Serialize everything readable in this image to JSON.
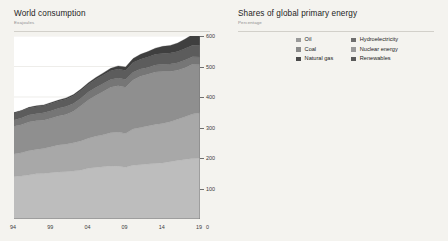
{
  "charts": [
    {
      "id": "world-consumption",
      "title": "World consumption",
      "subtitle": "Exajoules",
      "legend": [
        {
          "label": "Renewables",
          "color": "#3f3f3f"
        },
        {
          "label": "Hydroelectricity",
          "color": "#5c5c5c"
        },
        {
          "label": "Nuclear energy",
          "color": "#767676"
        },
        {
          "label": "Coal",
          "color": "#8f8f8f"
        },
        {
          "label": "Natural gas",
          "color": "#a8a8a8"
        },
        {
          "label": "Oil",
          "color": "#bdbdbd"
        }
      ],
      "yticks": [
        "600",
        "500",
        "400",
        "300",
        "200",
        "100"
      ],
      "xticks": [
        "94",
        "99",
        "04",
        "09",
        "14",
        "19"
      ],
      "zero": "0"
    },
    {
      "id": "shares-of-global-primary-energy",
      "title": "Shares of global primary energy",
      "subtitle": "Percentage",
      "legend_col1": [
        {
          "label": "Oil",
          "color": "#9a9a9a"
        },
        {
          "label": "Coal",
          "color": "#8a8a8a"
        },
        {
          "label": "Natural gas",
          "color": "#4a4a4a"
        }
      ],
      "legend_col2": [
        {
          "label": "Hydroelectricity",
          "color": "#6e6e6e"
        },
        {
          "label": "Nuclear energy",
          "color": "#9a9a9a"
        },
        {
          "label": "Renewables",
          "color": "#5a5a5a"
        }
      ],
      "yticks": [
        "50",
        "40",
        "30",
        "20",
        "10"
      ],
      "xticks": [
        "94",
        "99",
        "04",
        "09",
        "14",
        "19"
      ],
      "zero": "0"
    }
  ],
  "chart_data": [
    {
      "type": "area",
      "title": "World consumption",
      "subtitle": "Exajoules",
      "xlabel": "",
      "ylabel": "Exajoules",
      "ylim": [
        0,
        600
      ],
      "xlim": [
        1994,
        2019
      ],
      "grid": true,
      "legend_position": "top-left",
      "stacked": true,
      "x": [
        1994,
        1995,
        1996,
        1997,
        1998,
        1999,
        2000,
        2001,
        2002,
        2003,
        2004,
        2005,
        2006,
        2007,
        2008,
        2009,
        2010,
        2011,
        2012,
        2013,
        2014,
        2015,
        2016,
        2017,
        2018,
        2019
      ],
      "series": [
        {
          "name": "Oil",
          "color": "#bdbdbd",
          "values": [
            139,
            141,
            144,
            148,
            149,
            152,
            154,
            155,
            157,
            160,
            166,
            169,
            171,
            174,
            173,
            170,
            176,
            178,
            180,
            182,
            184,
            188,
            192,
            195,
            198,
            199
          ]
        },
        {
          "name": "Natural gas",
          "color": "#a8a8a8",
          "values": [
            74,
            76,
            80,
            80,
            82,
            85,
            89,
            90,
            93,
            96,
            99,
            102,
            105,
            109,
            112,
            110,
            119,
            122,
            125,
            128,
            129,
            131,
            135,
            140,
            146,
            149
          ]
        },
        {
          "name": "Coal",
          "color": "#8f8f8f",
          "values": [
            91,
            92,
            94,
            94,
            93,
            93,
            95,
            98,
            103,
            115,
            125,
            134,
            142,
            149,
            152,
            152,
            161,
            168,
            170,
            172,
            171,
            165,
            161,
            161,
            163,
            158
          ]
        },
        {
          "name": "Nuclear energy",
          "color": "#767676",
          "values": [
            21,
            22,
            23,
            23,
            24,
            25,
            25,
            26,
            26,
            25,
            26,
            26,
            26,
            25,
            25,
            25,
            25,
            24,
            22,
            23,
            23,
            24,
            24,
            25,
            25,
            25
          ]
        },
        {
          "name": "Hydroelectricity",
          "color": "#5c5c5c",
          "values": [
            22,
            23,
            23,
            23,
            23,
            24,
            24,
            24,
            25,
            25,
            26,
            27,
            28,
            29,
            30,
            30,
            32,
            32,
            34,
            35,
            36,
            36,
            37,
            38,
            38,
            38
          ]
        },
        {
          "name": "Renewables",
          "color": "#3f3f3f",
          "values": [
            2,
            2,
            2,
            3,
            3,
            3,
            3,
            4,
            4,
            5,
            5,
            6,
            7,
            8,
            10,
            11,
            13,
            16,
            18,
            20,
            23,
            25,
            28,
            31,
            35,
            39
          ]
        }
      ],
      "yticks": [
        100,
        200,
        300,
        400,
        500,
        600
      ],
      "xticks": [
        1994,
        1999,
        2004,
        2009,
        2014,
        2019
      ]
    },
    {
      "type": "line",
      "title": "Shares of global primary energy",
      "subtitle": "Percentage",
      "xlabel": "",
      "ylabel": "Percentage",
      "ylim": [
        0,
        50
      ],
      "xlim": [
        1994,
        2019
      ],
      "grid": true,
      "legend_position": "top-center",
      "x": [
        1994,
        1995,
        1996,
        1997,
        1998,
        1999,
        2000,
        2001,
        2002,
        2003,
        2004,
        2005,
        2006,
        2007,
        2008,
        2009,
        2010,
        2011,
        2012,
        2013,
        2014,
        2015,
        2016,
        2017,
        2018,
        2019
      ],
      "series": [
        {
          "name": "Oil",
          "color": "#9a9a9a",
          "values": [
            39.5,
            39.3,
            39.3,
            39.4,
            39.3,
            39.2,
            38.7,
            38.4,
            38.0,
            37.4,
            37.1,
            36.5,
            35.9,
            35.3,
            34.7,
            34.6,
            33.9,
            33.4,
            33.1,
            32.9,
            32.7,
            32.8,
            33.0,
            32.9,
            32.9,
            33.1
          ]
        },
        {
          "name": "Coal",
          "color": "#8a8a8a",
          "values": [
            26.0,
            25.8,
            25.8,
            25.6,
            25.0,
            24.8,
            25.0,
            25.3,
            25.8,
            27.2,
            28.2,
            28.9,
            29.5,
            30.0,
            30.0,
            29.8,
            30.0,
            30.5,
            30.3,
            30.3,
            30.1,
            28.9,
            28.1,
            27.8,
            27.6,
            27.0
          ]
        },
        {
          "name": "Natural gas",
          "color": "#4a4a4a",
          "values": [
            21.2,
            21.3,
            21.7,
            21.4,
            21.6,
            21.8,
            22.3,
            22.3,
            22.6,
            22.8,
            22.6,
            22.6,
            22.6,
            23.0,
            23.1,
            23.2,
            23.4,
            23.3,
            23.5,
            23.6,
            23.5,
            23.6,
            24.0,
            24.2,
            24.4,
            24.5
          ]
        },
        {
          "name": "Nuclear energy",
          "color": "#9a9a9a",
          "values": [
            6.9,
            6.8,
            6.8,
            6.7,
            6.7,
            6.8,
            6.6,
            6.6,
            6.5,
            6.2,
            6.1,
            5.9,
            5.8,
            5.5,
            5.3,
            5.4,
            5.2,
            4.9,
            4.4,
            4.4,
            4.4,
            4.4,
            4.4,
            4.4,
            4.3,
            4.3
          ]
        },
        {
          "name": "Hydroelectricity",
          "color": "#6e6e6e",
          "values": [
            6.2,
            6.2,
            6.1,
            6.1,
            6.1,
            6.2,
            6.2,
            6.1,
            6.1,
            6.0,
            6.0,
            6.0,
            6.1,
            6.1,
            6.2,
            6.4,
            6.4,
            6.3,
            6.5,
            6.6,
            6.7,
            6.7,
            6.7,
            6.7,
            6.6,
            6.4
          ]
        },
        {
          "name": "Renewables",
          "color": "#5a5a5a",
          "values": [
            0.5,
            0.5,
            0.6,
            0.6,
            0.7,
            0.7,
            0.7,
            0.8,
            0.9,
            0.9,
            1.0,
            1.1,
            1.2,
            1.4,
            1.6,
            1.8,
            2.1,
            2.5,
            2.8,
            3.1,
            3.5,
            3.9,
            4.3,
            4.8,
            5.4,
            5.9
          ]
        }
      ],
      "yticks": [
        10,
        20,
        30,
        40,
        50
      ],
      "xticks": [
        1994,
        1999,
        2004,
        2009,
        2014,
        2019
      ]
    }
  ]
}
